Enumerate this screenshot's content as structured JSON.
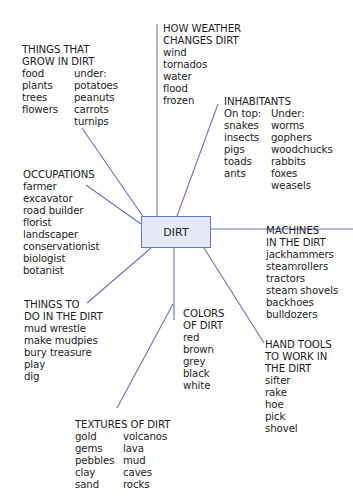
{
  "center": {
    "label": "DIRT"
  },
  "colors": {
    "line": "#6b73c4",
    "box_fill": "#e4e8f8",
    "box_border": "#6b73c4",
    "text": "#1e1e1e"
  },
  "topics": {
    "grow": {
      "title": [
        "THINGS THAT",
        "GROW IN DIRT"
      ],
      "col1": [
        "food",
        "plants",
        "trees",
        "flowers"
      ],
      "col2": [
        "under:",
        "potatoes",
        "peanuts",
        "carrots",
        "turnips"
      ]
    },
    "weather": {
      "title": [
        "HOW WEATHER",
        "CHANGES DIRT"
      ],
      "items": [
        "wind",
        "tornados",
        "water",
        "flood",
        "frozen"
      ]
    },
    "inhabitants": {
      "title": [
        "INHABITANTS"
      ],
      "col1": [
        "On top:",
        "snakes",
        "insects",
        "pigs",
        "toads",
        "ants"
      ],
      "col2": [
        "Under:",
        "worms",
        "gophers",
        "woodchucks",
        "rabbits",
        "foxes",
        "weasels"
      ]
    },
    "occupations": {
      "title": [
        "OCCUPATIONS"
      ],
      "items": [
        "farmer",
        "excavator",
        "road builder",
        "florist",
        "landscaper",
        "conservationist",
        "biologist",
        "botanist"
      ]
    },
    "machines": {
      "title": [
        "MACHINES",
        "IN THE DIRT"
      ],
      "items": [
        "jackhammers",
        "steamrollers",
        "tractors",
        "steam shovels",
        "backhoes",
        "bulldozers"
      ]
    },
    "todo": {
      "title": [
        "THINGS TO",
        "DO IN THE DIRT"
      ],
      "items": [
        "mud wrestle",
        "make mudpies",
        "bury treasure",
        "play",
        "dig"
      ]
    },
    "colors_of_dirt": {
      "title": [
        "COLORS",
        "OF DIRT"
      ],
      "items": [
        "red",
        "brown",
        "grey",
        "black",
        "white"
      ]
    },
    "tools": {
      "title": [
        "HAND TOOLS",
        "TO WORK IN",
        "THE DIRT"
      ],
      "items": [
        "sifter",
        "rake",
        "hoe",
        "pick",
        "shovel"
      ]
    },
    "textures": {
      "title": [
        "TEXTURES OF DIRT"
      ],
      "col1": [
        "gold",
        "gems",
        "pebbles",
        "clay",
        "sand"
      ],
      "col2": [
        "volcanos",
        "lava",
        "mud",
        "caves",
        "rocks"
      ]
    }
  }
}
